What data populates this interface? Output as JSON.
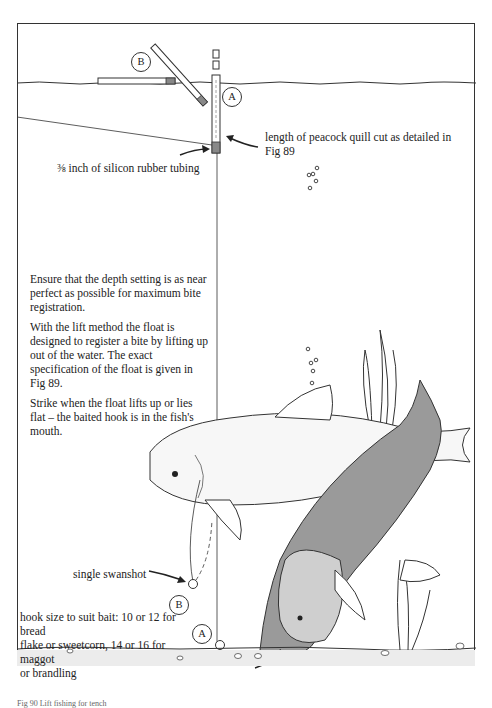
{
  "figure": {
    "labels": {
      "float_a": "A",
      "float_b": "B",
      "shot_b": "B",
      "hook_a": "A",
      "quill": "length of peacock quill cut as detailed in Fig 89",
      "quill_line1": "length of peacock quill cut as detailed in",
      "quill_line2": "Fig 89",
      "tubing": "⅜ inch of silicon rubber tubing",
      "swanshot": "single swanshot",
      "hook_line1": "hook size to suit bait: 10 or 12 for bread",
      "hook_line2": "flake or sweetcorn, 14 or 16 for maggot",
      "hook_line3": "or brandling"
    },
    "notes": [
      "Ensure that the depth setting is as near perfect as possible for maximum bite registration.",
      "With the lift method the float is designed to register a bite by lifting up out of the water. The exact specification of the float is given in Fig 89.",
      "Strike when the float lifts up or lies flat – the baited hook is in the fish's mouth."
    ],
    "caption": "Fig 90  Lift fishing for tench"
  }
}
